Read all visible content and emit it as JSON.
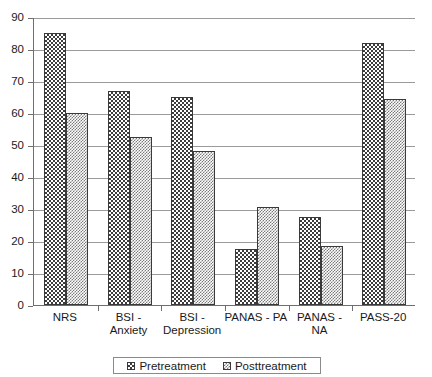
{
  "chart_data": {
    "type": "bar",
    "title": "",
    "subtitle": "",
    "xlabel": "",
    "ylabel": "",
    "categories": [
      "NRS",
      "BSI - Anxiety",
      "BSI - Depression",
      "PANAS - PA",
      "PANAS - NA",
      "PASS-20"
    ],
    "series": [
      {
        "name": "Pretreatment",
        "values": [
          85,
          67,
          65,
          17.5,
          27.5,
          82
        ]
      },
      {
        "name": "Posttreatment",
        "values": [
          60,
          52.5,
          48,
          30.5,
          18.5,
          64.5
        ]
      }
    ],
    "ylim": [
      0,
      90
    ],
    "ytick_step": 10,
    "ytick_labels": [
      "0",
      "10",
      "20",
      "30",
      "40",
      "50",
      "60",
      "70",
      "80",
      "90"
    ],
    "grid": "horizontal",
    "legend_position": "bottom"
  },
  "legend": {
    "items": [
      {
        "label": "Pretreatment",
        "swatch": "pretreatment-pattern-swatch"
      },
      {
        "label": "Posttreatment",
        "swatch": "posttreatment-pattern-swatch"
      }
    ]
  }
}
